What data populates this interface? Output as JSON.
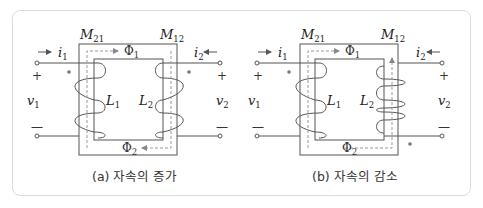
{
  "figures": [
    {
      "id": "a",
      "caption": "(a) 자속의 증가",
      "labels": {
        "mutual_left": "M",
        "mutual_left_sub": "21",
        "mutual_right": "M",
        "mutual_right_sub": "12",
        "current_left": "i",
        "current_left_sub": "1",
        "current_right": "i",
        "current_right_sub": "2",
        "voltage_left": "v",
        "voltage_left_sub": "1",
        "voltage_right": "v",
        "voltage_right_sub": "2",
        "inductor_left": "L",
        "inductor_left_sub": "1",
        "inductor_right": "L",
        "inductor_right_sub": "2",
        "flux_top": "Φ",
        "flux_top_sub": "1",
        "flux_bottom": "Φ",
        "flux_bottom_sub": "2",
        "plus": "+",
        "minus": "—"
      },
      "dot_positions": [
        "left-top",
        "right-top"
      ]
    },
    {
      "id": "b",
      "caption": "(b) 자속의 감소",
      "labels": {
        "mutual_left": "M",
        "mutual_left_sub": "21",
        "mutual_right": "M",
        "mutual_right_sub": "12",
        "current_left": "i",
        "current_left_sub": "1",
        "current_right": "i",
        "current_right_sub": "2",
        "voltage_left": "v",
        "voltage_left_sub": "1",
        "voltage_right": "v",
        "voltage_right_sub": "2",
        "inductor_left": "L",
        "inductor_left_sub": "1",
        "inductor_right": "L",
        "inductor_right_sub": "2",
        "flux_top": "Φ",
        "flux_top_sub": "1",
        "flux_bottom": "Φ",
        "flux_bottom_sub": "2",
        "plus": "+",
        "minus": "—"
      },
      "dot_positions": [
        "left-top",
        "right-bottom"
      ]
    }
  ],
  "colors": {
    "line": "#555555",
    "dash": "#999999",
    "dot": "#777777",
    "border": "#dcdcdc"
  }
}
